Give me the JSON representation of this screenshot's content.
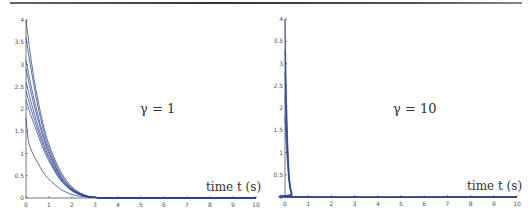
{
  "chart_data": [
    {
      "type": "line",
      "title": "",
      "annotation": "γ = 1",
      "xlabel": "time t (s)",
      "ylabel": "",
      "xlim": [
        0,
        10
      ],
      "ylim": [
        0,
        4
      ],
      "grid": false,
      "x_ticks": [
        "0",
        "1",
        "2",
        "3",
        "4",
        "5",
        "6",
        "7",
        "8",
        "9",
        "10"
      ],
      "y_ticks": [
        "0",
        "0.5",
        "1",
        "1.5",
        "2",
        "2.5",
        "3",
        "3.5",
        "4"
      ],
      "series": [
        {
          "name": "trajectory 1",
          "x": [
            0,
            0.25,
            0.5,
            0.75,
            1,
            1.5,
            2,
            2.5,
            3,
            4,
            10
          ],
          "y": [
            4.0,
            3.0,
            2.25,
            1.65,
            1.2,
            0.6,
            0.25,
            0.08,
            0.02,
            0,
            0
          ]
        },
        {
          "name": "trajectory 2",
          "x": [
            0,
            0.25,
            0.5,
            0.75,
            1,
            1.5,
            2,
            2.5,
            3,
            4,
            10
          ],
          "y": [
            3.6,
            2.8,
            2.1,
            1.55,
            1.12,
            0.55,
            0.22,
            0.07,
            0.02,
            0,
            0
          ]
        },
        {
          "name": "trajectory 3",
          "x": [
            0,
            0.25,
            0.5,
            0.75,
            1,
            1.5,
            2,
            2.5,
            3,
            4,
            10
          ],
          "y": [
            3.1,
            2.45,
            1.9,
            1.42,
            1.05,
            0.5,
            0.2,
            0.06,
            0.015,
            0,
            0
          ]
        },
        {
          "name": "trajectory 4",
          "x": [
            0,
            0.25,
            0.5,
            0.75,
            1,
            1.5,
            2,
            2.5,
            3,
            4,
            10
          ],
          "y": [
            2.9,
            2.3,
            1.8,
            1.35,
            1.0,
            0.48,
            0.19,
            0.06,
            0.015,
            0,
            0
          ]
        },
        {
          "name": "trajectory 5",
          "x": [
            0,
            0.25,
            0.5,
            0.75,
            1,
            1.5,
            2,
            2.5,
            3,
            4,
            10
          ],
          "y": [
            2.6,
            2.1,
            1.65,
            1.25,
            0.93,
            0.45,
            0.18,
            0.05,
            0.01,
            0,
            0
          ]
        },
        {
          "name": "trajectory 6",
          "x": [
            0,
            0.25,
            0.5,
            0.75,
            1,
            1.5,
            2,
            2.5,
            3,
            4,
            10
          ],
          "y": [
            2.4,
            1.95,
            1.55,
            1.18,
            0.88,
            0.42,
            0.17,
            0.05,
            0.01,
            0,
            0
          ]
        },
        {
          "name": "trajectory 7",
          "x": [
            0,
            0.25,
            0.5,
            0.75,
            1,
            1.5,
            2,
            2.5,
            3,
            4,
            10
          ],
          "y": [
            2.2,
            1.8,
            1.45,
            1.1,
            0.83,
            0.4,
            0.16,
            0.05,
            0.01,
            0,
            0
          ]
        },
        {
          "name": "trajectory 8",
          "x": [
            0,
            0.1,
            0.25,
            0.5,
            0.75,
            1,
            1.5,
            2,
            2.5,
            3,
            4,
            10
          ],
          "y": [
            1.8,
            1.3,
            1.05,
            0.8,
            0.58,
            0.42,
            0.2,
            0.08,
            0.03,
            0.01,
            0,
            0
          ]
        }
      ]
    },
    {
      "type": "line",
      "title": "",
      "annotation": "γ = 10",
      "xlabel": "time t (s)",
      "ylabel": "",
      "xlim": [
        0,
        10
      ],
      "ylim": [
        0,
        4
      ],
      "grid": false,
      "x_ticks": [
        "0",
        "1",
        "2",
        "3",
        "4",
        "5",
        "6",
        "7",
        "8",
        "9",
        "10"
      ],
      "y_ticks": [
        "0",
        "0.5",
        "1",
        "1.5",
        "2",
        "2.5",
        "3",
        "3.5",
        "4"
      ],
      "series": [
        {
          "name": "trajectory 1",
          "x": [
            0,
            0.05,
            0.1,
            0.15,
            0.2,
            0.3,
            0.5,
            10
          ],
          "y": [
            4.0,
            2.6,
            1.5,
            0.8,
            0.4,
            0.08,
            0,
            0
          ]
        },
        {
          "name": "trajectory 2",
          "x": [
            0,
            0.05,
            0.1,
            0.15,
            0.2,
            0.3,
            0.5,
            10
          ],
          "y": [
            3.3,
            2.2,
            1.3,
            0.7,
            0.35,
            0.07,
            0,
            0
          ]
        },
        {
          "name": "trajectory 3",
          "x": [
            0,
            0.05,
            0.1,
            0.15,
            0.2,
            0.3,
            0.5,
            10
          ],
          "y": [
            2.8,
            1.9,
            1.15,
            0.62,
            0.3,
            0.06,
            0,
            0
          ]
        },
        {
          "name": "trajectory 4",
          "x": [
            0,
            0.05,
            0.1,
            0.15,
            0.2,
            0.3,
            0.5,
            10
          ],
          "y": [
            2.3,
            1.6,
            1.0,
            0.55,
            0.27,
            0.05,
            0,
            0
          ]
        },
        {
          "name": "trajectory 5",
          "x": [
            0,
            0.05,
            0.1,
            0.15,
            0.2,
            0.3,
            0.5,
            10
          ],
          "y": [
            1.8,
            1.25,
            0.8,
            0.45,
            0.22,
            0.04,
            0,
            0
          ]
        }
      ]
    }
  ],
  "panels": [
    {
      "annotation": "γ = 1",
      "xlabel": "time t (s)"
    },
    {
      "annotation": "γ = 10",
      "xlabel": "time t (s)"
    }
  ],
  "colors": {
    "line": "#2b3f8c",
    "axis": "#555555"
  }
}
